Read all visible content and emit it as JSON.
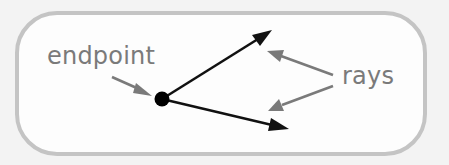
{
  "diagram": {
    "labels": {
      "endpoint": "endpoint",
      "rays": "rays"
    },
    "colors": {
      "background": "#f3f3f3",
      "frame_fill": "#fdfdfd",
      "frame_border": "#c4c4c4",
      "label_text": "#7a7a7a",
      "annotation_arrow": "#7a7a7a",
      "ray": "#111111",
      "endpoint_dot": "#000000"
    },
    "endpoint": {
      "x": 162,
      "y": 99,
      "r": 7
    },
    "rays": [
      {
        "name": "upper-ray",
        "from": [
          162,
          99
        ],
        "to": [
          271,
          31
        ]
      },
      {
        "name": "lower-ray",
        "from": [
          162,
          99
        ],
        "to": [
          288,
          129
        ]
      }
    ],
    "annotation_arrows": [
      {
        "name": "endpoint-pointer",
        "from": [
          112,
          77
        ],
        "to": [
          152,
          95
        ]
      },
      {
        "name": "rays-pointer-upper",
        "from": [
          333,
          75
        ],
        "to": [
          266,
          50
        ]
      },
      {
        "name": "rays-pointer-lower",
        "from": [
          333,
          86
        ],
        "to": [
          267,
          111
        ]
      }
    ]
  }
}
